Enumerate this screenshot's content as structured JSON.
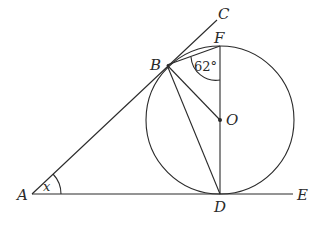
{
  "diagram": {
    "title": "",
    "points": {
      "A": {
        "label": "A",
        "x": 32,
        "y": 194
      },
      "B": {
        "label": "B",
        "x": 167,
        "y": 65
      },
      "C": {
        "label": "C",
        "x": 217,
        "y": 20
      },
      "F": {
        "label": "F",
        "x": 220,
        "y": 46
      },
      "O": {
        "label": "O",
        "x": 220,
        "y": 120
      },
      "D": {
        "label": "D",
        "x": 220,
        "y": 194
      },
      "E": {
        "label": "E",
        "x": 293,
        "y": 194
      }
    },
    "circle": {
      "center": "O",
      "radius": 74
    },
    "segments": [
      "A-C",
      "A-E",
      "B-F",
      "B-D",
      "B-O",
      "F-D"
    ],
    "angles": [
      {
        "vertex": "B",
        "label": "62°",
        "between": [
          "F",
          "O"
        ]
      },
      {
        "vertex": "A",
        "label": "x",
        "between": [
          "B",
          "E"
        ]
      }
    ],
    "labels": {
      "A": "A",
      "B": "B",
      "C": "C",
      "D": "D",
      "E": "E",
      "F": "F",
      "O": "O",
      "angle_B": "62°",
      "angle_A": "x"
    }
  }
}
